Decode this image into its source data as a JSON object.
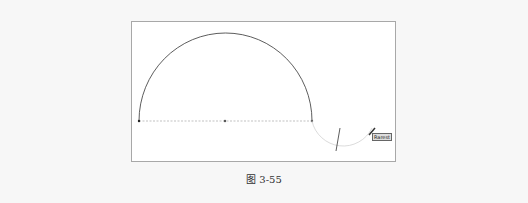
{
  "figure": {
    "caption": "图 3-55",
    "cursor_tooltip": "Rarest",
    "colors": {
      "background": "#f7f7f7",
      "canvas": "#ffffff",
      "arc": "#333333",
      "preview_arc": "#cccccc",
      "guide_line": "#999999"
    }
  }
}
